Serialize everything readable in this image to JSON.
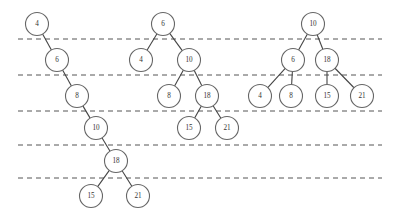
{
  "figure": {
    "kind": "binary-search-tree-insertion-diagram",
    "width": 395,
    "height": 219,
    "background_color": "#ffffff",
    "node": {
      "radius": 11.5,
      "fill_color": "#ffffff",
      "stroke_color": "#666666",
      "label_color": "#333333"
    },
    "edge": {
      "stroke_color": "#444444"
    },
    "level_lines": {
      "stroke_color": "#555555",
      "dash_pattern": "5 4",
      "x_start": 18,
      "x_end": 382,
      "y_values": [
        39,
        75,
        111,
        145,
        178
      ]
    }
  },
  "trees": [
    {
      "name": "degenerate-right-skewed-tree",
      "nodes": [
        {
          "label": "4",
          "cx": 37,
          "cy": 24
        },
        {
          "label": "6",
          "cx": 57,
          "cy": 60
        },
        {
          "label": "8",
          "cx": 77,
          "cy": 96
        },
        {
          "label": "10",
          "cx": 96,
          "cy": 128
        },
        {
          "label": "18",
          "cx": 116,
          "cy": 161
        },
        {
          "label": "15",
          "cx": 91,
          "cy": 196
        },
        {
          "label": "21",
          "cx": 138,
          "cy": 196
        }
      ],
      "edges": [
        {
          "from": "4",
          "to": "6"
        },
        {
          "from": "6",
          "to": "8"
        },
        {
          "from": "8",
          "to": "10"
        },
        {
          "from": "10",
          "to": "18"
        },
        {
          "from": "18",
          "to": "15"
        },
        {
          "from": "18",
          "to": "21"
        }
      ]
    },
    {
      "name": "partially-balanced-tree",
      "nodes": [
        {
          "label": "6",
          "cx": 163,
          "cy": 24
        },
        {
          "label": "4",
          "cx": 141,
          "cy": 60
        },
        {
          "label": "10",
          "cx": 189,
          "cy": 60
        },
        {
          "label": "8",
          "cx": 169,
          "cy": 96
        },
        {
          "label": "18",
          "cx": 207,
          "cy": 96
        },
        {
          "label": "15",
          "cx": 189,
          "cy": 128
        },
        {
          "label": "21",
          "cx": 227,
          "cy": 128
        }
      ],
      "edges": [
        {
          "from": "6",
          "to": "4"
        },
        {
          "from": "6",
          "to": "10"
        },
        {
          "from": "10",
          "to": "8"
        },
        {
          "from": "10",
          "to": "18"
        },
        {
          "from": "18",
          "to": "15"
        },
        {
          "from": "18",
          "to": "21"
        }
      ]
    },
    {
      "name": "fully-balanced-tree",
      "nodes": [
        {
          "label": "10",
          "cx": 313,
          "cy": 24
        },
        {
          "label": "6",
          "cx": 293,
          "cy": 60
        },
        {
          "label": "18",
          "cx": 327,
          "cy": 60
        },
        {
          "label": "4",
          "cx": 260,
          "cy": 96
        },
        {
          "label": "8",
          "cx": 291,
          "cy": 96
        },
        {
          "label": "15",
          "cx": 327,
          "cy": 96
        },
        {
          "label": "21",
          "cx": 362,
          "cy": 96
        }
      ],
      "edges": [
        {
          "from": "10",
          "to": "6"
        },
        {
          "from": "10",
          "to": "18"
        },
        {
          "from": "6",
          "to": "4"
        },
        {
          "from": "6",
          "to": "8"
        },
        {
          "from": "18",
          "to": "15"
        },
        {
          "from": "18",
          "to": "21"
        }
      ]
    }
  ]
}
